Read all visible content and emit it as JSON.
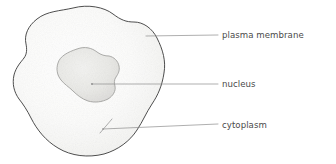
{
  "diagram": {
    "background_color": "#ffffff",
    "labels": [
      {
        "id": "plasma-membrane",
        "text": "plasma membrane",
        "text_x": 222,
        "text_y": 38,
        "leader_from_x": 146,
        "leader_from_y": 36,
        "leader_to_x": 218,
        "leader_to_y": 35
      },
      {
        "id": "nucleus",
        "text": "nucleus",
        "text_x": 222,
        "text_y": 87,
        "leader_from_x": 92,
        "leader_from_y": 84,
        "leader_to_x": 218,
        "leader_to_y": 84
      },
      {
        "id": "cytoplasm",
        "text": "cytoplasm",
        "text_x": 222,
        "text_y": 128,
        "leader_from_x": 103,
        "leader_from_y": 129,
        "leader_to_x": 218,
        "leader_to_y": 124
      }
    ],
    "structures": {
      "cell": {
        "name": "cell body",
        "fill_color": "#fbfbfa",
        "stroke_color": "#3a3a3a",
        "stroke_width": 0.9
      },
      "nucleus": {
        "name": "nucleus",
        "fill_color": "#ececea",
        "stroke_color": "#9a9a98",
        "stroke_width": 0.8
      },
      "leader_line": {
        "stroke_color": "#8c8c8c",
        "stroke_width": 0.7
      }
    }
  }
}
